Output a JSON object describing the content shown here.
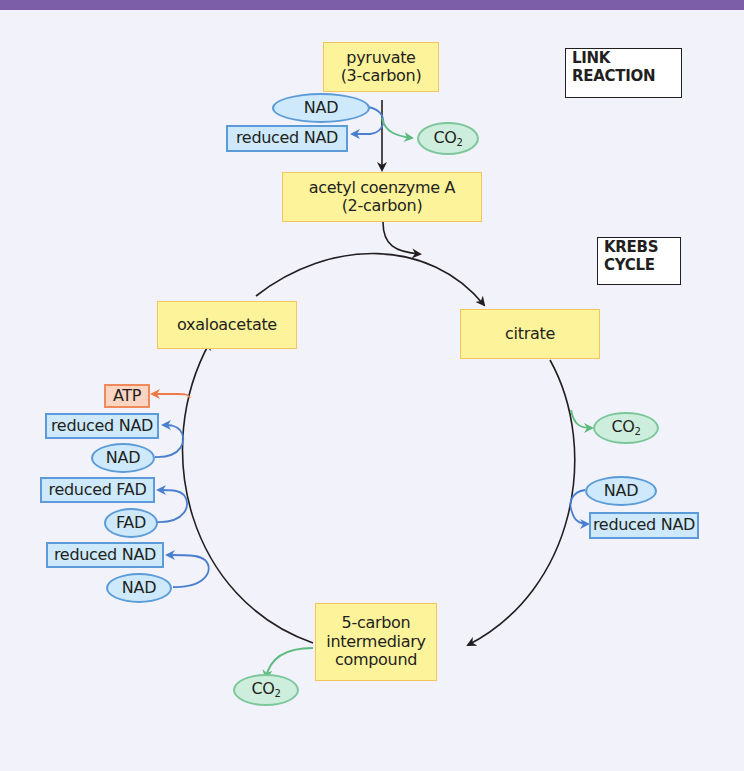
{
  "header_bar": {
    "color": "#7b5ea7"
  },
  "colors": {
    "background": "#f1f2fa",
    "compound_fill": "#fdf39b",
    "compound_border": "#f4c55d",
    "carrier_fill": "#cde9fb",
    "carrier_border": "#5b9bd8",
    "co2_fill": "#cdeedd",
    "co2_border": "#7cc79a",
    "atp_fill": "#fbd4c2",
    "atp_border": "#f08a5a"
  },
  "section_labels": {
    "link_reaction": [
      "LINK",
      "REACTION"
    ],
    "krebs_cycle": [
      "KREBS",
      "CYCLE"
    ]
  },
  "link_reaction": {
    "pyruvate": [
      "pyruvate",
      "(3-carbon)"
    ],
    "nad": "NAD",
    "reduced_nad": "reduced NAD",
    "co2": {
      "main": "CO",
      "sub": "2"
    },
    "acetyl_coa": [
      "acetyl coenzyme A",
      "(2-carbon)"
    ]
  },
  "krebs_cycle": {
    "citrate": "citrate",
    "oxaloacetate": "oxaloacetate",
    "five_carbon": [
      "5-carbon",
      "intermediary",
      "compound"
    ],
    "right_side": {
      "co2": {
        "main": "CO",
        "sub": "2"
      },
      "nad": "NAD",
      "reduced_nad": "reduced NAD"
    },
    "bottom": {
      "co2": {
        "main": "CO",
        "sub": "2"
      }
    },
    "left_side": {
      "atp": "ATP",
      "reduced_nad_1": "reduced NAD",
      "nad_1": "NAD",
      "reduced_fad": "reduced FAD",
      "fad": "FAD",
      "reduced_nad_2": "reduced NAD",
      "nad_2": "NAD"
    }
  }
}
